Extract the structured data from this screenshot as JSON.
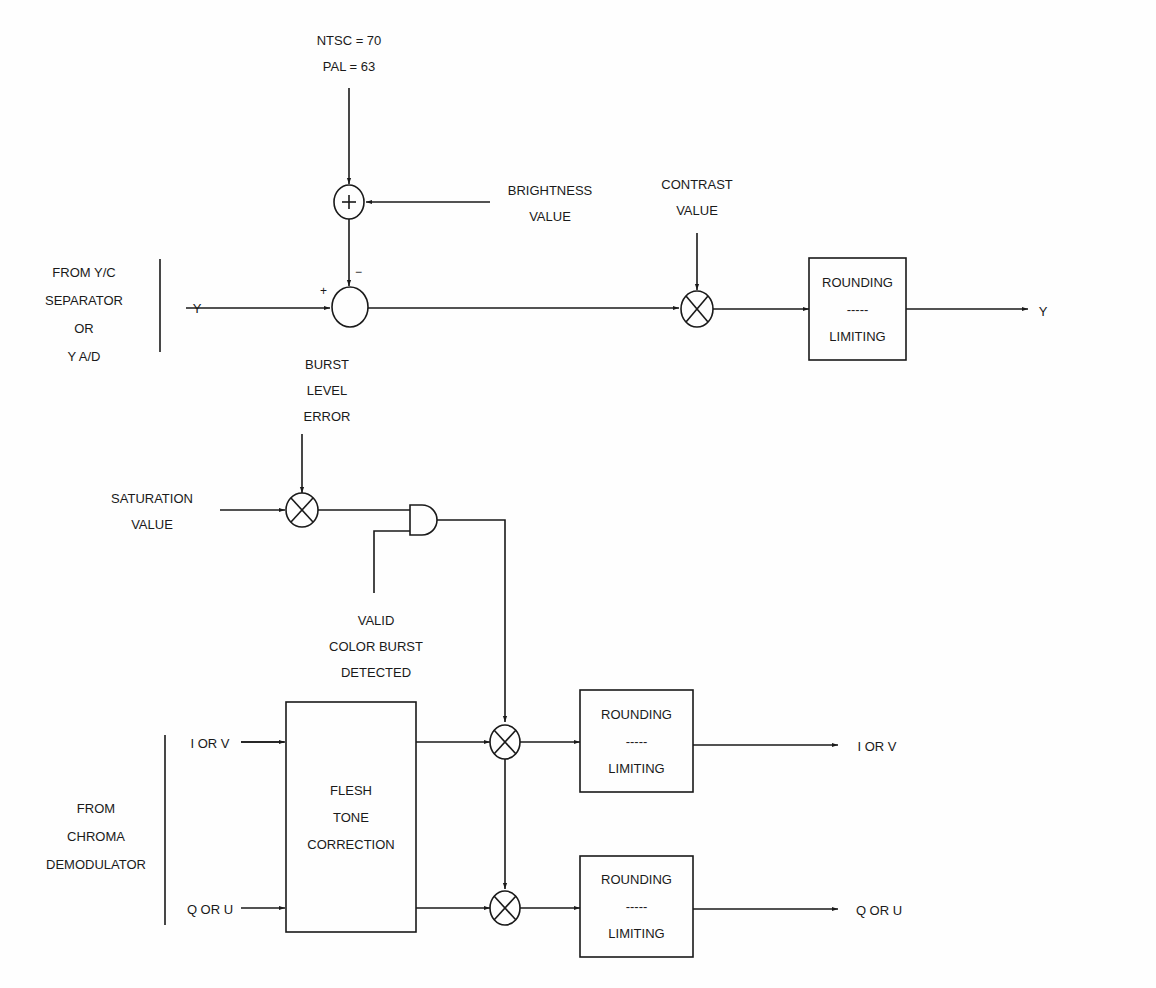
{
  "diagram": {
    "inputs": {
      "ntsc_pal": [
        "NTSC = 70",
        "PAL = 63"
      ],
      "brightness": [
        "BRIGHTNESS",
        "VALUE"
      ],
      "contrast": [
        "CONTRAST",
        "VALUE"
      ],
      "y_source": [
        "FROM Y/C",
        "SEPARATOR",
        "OR",
        "Y A/D"
      ],
      "y_in": "Y",
      "burst_level": [
        "BURST",
        "LEVEL",
        "ERROR"
      ],
      "saturation": [
        "SATURATION",
        "VALUE"
      ],
      "valid_burst": [
        "VALID",
        "COLOR BURST",
        "DETECTED"
      ],
      "chroma_source": [
        "FROM",
        "CHROMA",
        "DEMODULATOR"
      ],
      "i_in": "I OR V",
      "q_in": "Q OR U"
    },
    "signs": {
      "plus_top": "+",
      "minus": "−",
      "plus_left": "+"
    },
    "blocks": {
      "flesh_tone": [
        "FLESH",
        "TONE",
        "CORRECTION"
      ],
      "round_y": [
        "ROUNDING",
        "-----",
        "LIMITING"
      ],
      "round_i": [
        "ROUNDING",
        "-----",
        "LIMITING"
      ],
      "round_q": [
        "ROUNDING",
        "-----",
        "LIMITING"
      ]
    },
    "outputs": {
      "y_out": "Y",
      "i_out": "I OR V",
      "q_out": "Q OR U"
    }
  }
}
